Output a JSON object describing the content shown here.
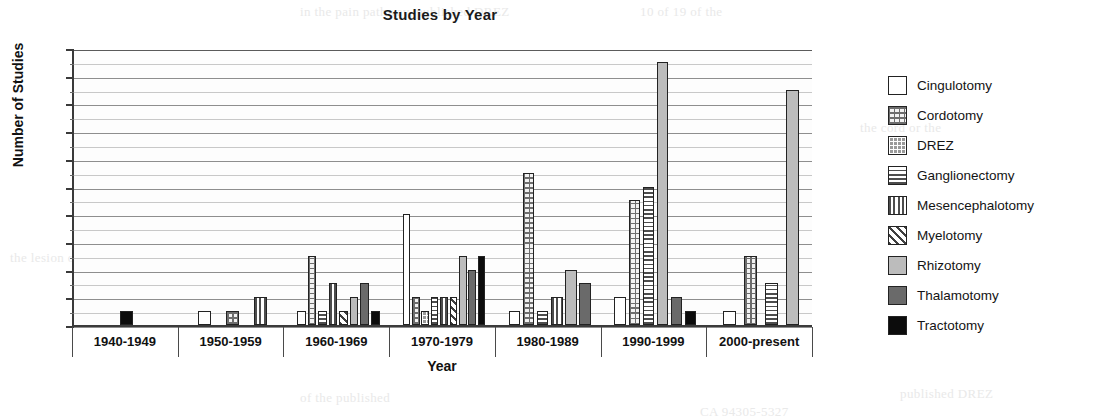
{
  "chart_data": {
    "type": "bar",
    "title": "Studies by Year",
    "xlabel": "Year",
    "ylabel": "Number of Studies",
    "ylim": [
      0,
      20
    ],
    "ytick_step": 2,
    "yticks": [
      0,
      2,
      4,
      6,
      8,
      10,
      12,
      14,
      16,
      18,
      20
    ],
    "grid": true,
    "minor_gridlines": true,
    "legend_position": "right",
    "categories": [
      "1940-1949",
      "1950-1959",
      "1960-1969",
      "1970-1979",
      "1980-1989",
      "1990-1999",
      "2000-present"
    ],
    "series": [
      {
        "name": "Cingulotomy",
        "pattern": "white-empty",
        "values": [
          0,
          1,
          1,
          8,
          1,
          2,
          1
        ]
      },
      {
        "name": "Cordotomy",
        "pattern": "light-grid",
        "values": [
          0,
          1,
          5,
          2,
          11,
          9,
          5
        ]
      },
      {
        "name": "DREZ",
        "pattern": "dark-grid",
        "values": [
          0,
          0,
          0,
          1,
          0,
          0,
          0
        ]
      },
      {
        "name": "Ganglionectomy",
        "pattern": "horizontal-lines",
        "values": [
          0,
          0,
          1,
          2,
          1,
          10,
          3
        ]
      },
      {
        "name": "Mesencephalotomy",
        "pattern": "vertical-lines",
        "values": [
          0,
          2,
          3,
          2,
          2,
          0,
          0
        ]
      },
      {
        "name": "Myelotomy",
        "pattern": "diagonal-lines",
        "values": [
          0,
          0,
          1,
          2,
          0,
          0,
          0
        ]
      },
      {
        "name": "Rhizotomy",
        "pattern": "light-gray-solid",
        "values": [
          0,
          0,
          2,
          5,
          4,
          19,
          17
        ]
      },
      {
        "name": "Thalamotomy",
        "pattern": "dark-gray-solid",
        "values": [
          0,
          0,
          3,
          4,
          3,
          2,
          0
        ]
      },
      {
        "name": "Tractotomy",
        "pattern": "black-solid",
        "values": [
          1,
          0,
          1,
          5,
          0,
          1,
          0
        ]
      }
    ]
  },
  "legend": {
    "items": [
      {
        "label": "Cingulotomy",
        "swatch": "white-empty-swatch",
        "color": "#ffffff"
      },
      {
        "label": "Cordotomy",
        "swatch": "light-grid-swatch",
        "color": "#f2f2f2"
      },
      {
        "label": "DREZ",
        "swatch": "dark-grid-swatch",
        "color": "#9a9a9a"
      },
      {
        "label": "Ganglionectomy",
        "swatch": "horizontal-lines-swatch",
        "color": "#4d4d4d"
      },
      {
        "label": "Mesencephalotomy",
        "swatch": "vertical-lines-swatch",
        "color": "#4d4d4d"
      },
      {
        "label": "Myelotomy",
        "swatch": "diagonal-lines-swatch",
        "color": "#3f3f3f"
      },
      {
        "label": "Rhizotomy",
        "swatch": "light-gray-solid-swatch",
        "color": "#bcbcbc"
      },
      {
        "label": "Thalamotomy",
        "swatch": "dark-gray-solid-swatch",
        "color": "#6a6a6a"
      },
      {
        "label": "Tractotomy",
        "swatch": "black-solid-swatch",
        "color": "#0c0c0c"
      }
    ]
  },
  "page_bleed": {
    "lines": [
      "in the pain pathway, published DREZ",
      "10 of 19 of the",
      "the cord or the",
      "the lesion of the",
      "published DREZ",
      "of the published",
      "CA 94305-5327"
    ]
  }
}
